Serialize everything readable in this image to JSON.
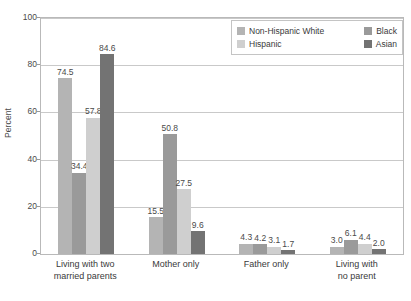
{
  "chart_data": {
    "type": "bar",
    "title": "",
    "xlabel": "",
    "ylabel": "Percent",
    "ylim": [
      0,
      100
    ],
    "yticks": [
      "0",
      "20",
      "40",
      "60",
      "80",
      "100"
    ],
    "grid": true,
    "legend_position": "top-right",
    "categories": [
      "Living with two married parents",
      "Mother only",
      "Father only",
      "Living with no parent"
    ],
    "category_lines": [
      [
        "Living with two",
        "married parents"
      ],
      [
        "Mother only",
        ""
      ],
      [
        "Father only",
        ""
      ],
      [
        "Living with",
        "no parent"
      ]
    ],
    "series": [
      {
        "name": "Non-Hispanic White",
        "color": "#b4b4b4",
        "values": [
          74.5,
          15.5,
          4.3,
          3.0
        ],
        "labels": [
          "74.5",
          "15.5",
          "4.3",
          "3.0"
        ]
      },
      {
        "name": "Black",
        "color": "#9a9a9a",
        "values": [
          34.4,
          50.8,
          4.2,
          6.1
        ],
        "labels": [
          "34.4",
          "50.8",
          "4.2",
          "6.1"
        ]
      },
      {
        "name": "Hispanic",
        "color": "#cfcfcf",
        "values": [
          57.8,
          27.5,
          3.1,
          4.4
        ],
        "labels": [
          "57.8",
          "27.5",
          "3.1",
          "4.4"
        ]
      },
      {
        "name": "Asian",
        "color": "#737373",
        "values": [
          84.6,
          9.6,
          1.7,
          2.0
        ],
        "labels": [
          "84.6",
          "9.6",
          "1.7",
          "2.0"
        ]
      }
    ]
  },
  "legend": {
    "rows": [
      [
        {
          "label": "Non-Hispanic White",
          "color": "#b4b4b4"
        },
        {
          "label": "Black",
          "color": "#9a9a9a"
        }
      ],
      [
        {
          "label": "Hispanic",
          "color": "#cfcfcf"
        },
        {
          "label": "Asian",
          "color": "#737373"
        }
      ]
    ]
  },
  "axis": {
    "y_title": "Percent"
  }
}
